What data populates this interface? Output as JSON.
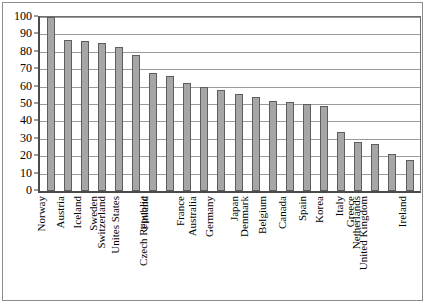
{
  "chart_data": {
    "type": "bar",
    "title": "",
    "subtitle": "",
    "xlabel": "",
    "ylabel": "",
    "ylim": [
      0,
      100
    ],
    "ytick_step": 10,
    "yticks": [
      100,
      90,
      80,
      70,
      60,
      50,
      40,
      30,
      20,
      10,
      0
    ],
    "grid": true,
    "grid_axis": "y",
    "legend": false,
    "legend_position": "none",
    "bar_color": "#a6a6a6",
    "bar_edge_color": "#5e5e5e",
    "axis_color": "#4a4a4a",
    "gridline_color": "#9a9a9a",
    "orientation": "vertical",
    "xtick_rotation": 90,
    "categories": [
      "Norway",
      "Austria",
      "Iceland",
      "Sweden",
      "Switzerland",
      "Unites States",
      "Finland",
      "Czech Republic",
      "France",
      "Australia",
      "Germany",
      "Japan",
      "Denmark",
      "Belgium",
      "Canada",
      "Spain",
      "Korea",
      "Italy",
      "Greece",
      "Netherlands",
      "United Kingdom",
      "Ireland"
    ],
    "values": [
      100,
      87,
      86,
      85,
      83,
      78,
      68,
      66,
      62,
      60,
      58,
      56,
      54,
      52,
      51,
      50,
      49,
      34,
      28,
      27,
      21,
      18
    ]
  }
}
